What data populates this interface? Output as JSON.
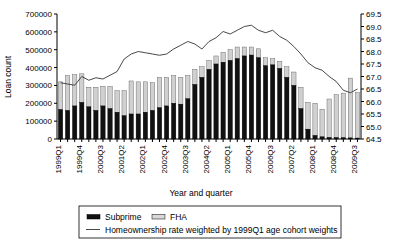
{
  "chart_data": {
    "type": "bar",
    "title": "",
    "xlabel": "Year and quarter",
    "ylabel": "Loan count",
    "y2label": "",
    "ylim": [
      0,
      700000
    ],
    "yticks": [
      0,
      100000,
      200000,
      300000,
      400000,
      500000,
      600000,
      700000
    ],
    "ytick_labels": [
      "0",
      "100000",
      "200000",
      "300000",
      "400000",
      "500000",
      "600000",
      "700000"
    ],
    "y2lim": [
      64.5,
      69.5
    ],
    "y2ticks": [
      64.5,
      65.0,
      65.5,
      66.0,
      66.5,
      67.0,
      67.5,
      68.0,
      68.5,
      69.0,
      69.5
    ],
    "y2tick_labels": [
      "64.5",
      "65.0",
      "65.5",
      "66.0",
      "66.5",
      "67.0",
      "67.5",
      "68.0",
      "68.5",
      "69.0",
      "69.5"
    ],
    "grid": false,
    "stacked": true,
    "legend_position": "bottom",
    "categories": [
      "1999Q1",
      "1999Q2",
      "1999Q3",
      "1999Q4",
      "2000Q1",
      "2000Q2",
      "2000Q3",
      "2000Q4",
      "2001Q1",
      "2001Q2",
      "2001Q3",
      "2001Q4",
      "2002Q1",
      "2002Q2",
      "2002Q3",
      "2002Q4",
      "2003Q1",
      "2003Q2",
      "2003Q3",
      "2003Q4",
      "2004Q1",
      "2004Q2",
      "2004Q3",
      "2004Q4",
      "2005Q1",
      "2005Q2",
      "2005Q3",
      "2005Q4",
      "2006Q1",
      "2006Q2",
      "2006Q3",
      "2006Q4",
      "2007Q1",
      "2007Q2",
      "2007Q3",
      "2007Q4",
      "2008Q1",
      "2008Q2",
      "2008Q3",
      "2008Q4",
      "2009Q1",
      "2009Q2",
      "2009Q3"
    ],
    "xtick_labels_shown": [
      "1999Q1",
      "1999Q4",
      "2000Q3",
      "2001Q2",
      "2002Q1",
      "2002Q4",
      "2003Q3",
      "2004Q2",
      "2005Q1",
      "2005Q4",
      "2006Q3",
      "2007Q2",
      "2008Q1",
      "2008Q4",
      "2009Q3"
    ],
    "xtick_label_interval": 3,
    "series": [
      {
        "name": "Subprime",
        "color": "#111111",
        "values": [
          165000,
          160000,
          185000,
          205000,
          180000,
          160000,
          185000,
          170000,
          150000,
          130000,
          140000,
          140000,
          150000,
          160000,
          175000,
          185000,
          200000,
          195000,
          225000,
          305000,
          345000,
          390000,
          420000,
          430000,
          440000,
          450000,
          465000,
          470000,
          455000,
          410000,
          415000,
          395000,
          345000,
          300000,
          170000,
          55000,
          20000,
          12000,
          9000,
          8000,
          7000,
          6000,
          5000
        ]
      },
      {
        "name": "FHA",
        "color": "#d0d0d0",
        "values": [
          155000,
          195000,
          175000,
          160000,
          110000,
          130000,
          110000,
          125000,
          120000,
          140000,
          185000,
          180000,
          170000,
          155000,
          170000,
          160000,
          155000,
          150000,
          130000,
          85000,
          60000,
          50000,
          45000,
          55000,
          60000,
          65000,
          50000,
          45000,
          50000,
          45000,
          35000,
          40000,
          60000,
          75000,
          120000,
          150000,
          180000,
          155000,
          215000,
          240000,
          250000,
          335000,
          255000
        ]
      }
    ],
    "line_series": {
      "name": "Homeownership rate weighted by 1999Q1 age cohort weights",
      "color": "#333333",
      "axis": "right",
      "values": [
        66.75,
        66.7,
        66.65,
        67.0,
        66.85,
        66.95,
        66.9,
        67.05,
        67.2,
        67.7,
        67.9,
        68.0,
        67.95,
        67.9,
        67.85,
        67.9,
        68.1,
        68.25,
        68.4,
        68.3,
        68.1,
        68.4,
        68.55,
        68.8,
        68.7,
        68.85,
        69.0,
        69.05,
        68.85,
        68.75,
        68.85,
        68.6,
        68.45,
        68.2,
        67.9,
        67.55,
        67.35,
        67.25,
        67.0,
        66.8,
        66.45,
        66.35,
        66.5
      ]
    },
    "legend": [
      {
        "label": "Subprime",
        "type": "swatch-filled"
      },
      {
        "label": "FHA",
        "type": "swatch-open"
      },
      {
        "label": "Homeownership rate weighted by 1999Q1 age cohort weights",
        "type": "line"
      }
    ]
  }
}
